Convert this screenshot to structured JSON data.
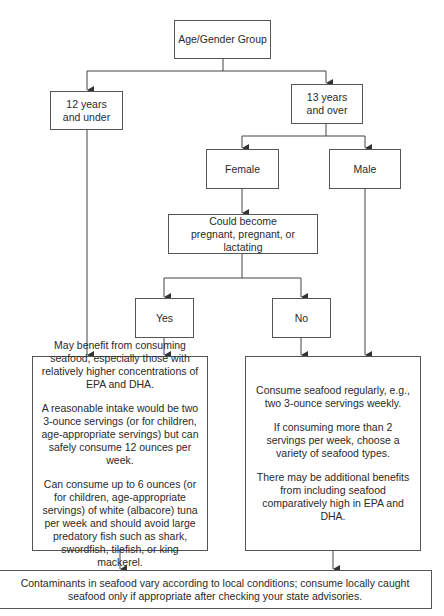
{
  "nodes": {
    "root": "Age/Gender Group",
    "under12": "12 years and under",
    "over13": "13 years and over",
    "female": "Female",
    "male": "Male",
    "pregnant": "Could become pregnant, pregnant, or lactating",
    "yes": "Yes",
    "no": "No",
    "advice_left": [
      "May benefit from consuming seafood, especially those with relatively higher concentrations of EPA and DHA.",
      "A reasonable intake would be two 3-ounce servings (or for children, age-appropriate servings) but can safely consume 12 ounces per week.",
      "Can consume up to 6 ounces (or for children, age-appropriate servings) of white (albacore) tuna per week and should avoid large predatory fish such as shark, swordfish, tilefish, or king mackerel."
    ],
    "advice_right": [
      "Consume seafood regularly, e.g., two 3-ounce servings weekly.",
      "If consuming more than 2 servings per week, choose a variety of seafood types.",
      "There may be additional benefits from including seafood comparatively high in EPA and DHA."
    ],
    "footer": "Contaminants in seafood vary according to local conditions; consume locally caught seafood only if appropriate after checking your state advisories."
  }
}
